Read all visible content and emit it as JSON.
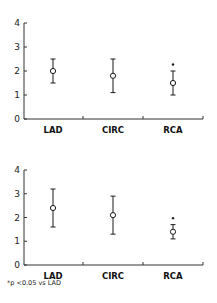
{
  "chart_data": [
    {
      "type": "scatter",
      "subtype": "mean-with-error-bars",
      "title": "",
      "xlabel": "",
      "ylabel": "",
      "categories": [
        "LAD",
        "CIRC",
        "RCA"
      ],
      "yticks": [
        "0",
        "1",
        "2",
        "3",
        "4"
      ],
      "ylim": [
        0,
        4
      ],
      "grid": false,
      "legend": null,
      "series": [
        {
          "name": "Panel 1",
          "mean": [
            2.0,
            1.8,
            1.5
          ],
          "upper": [
            2.5,
            2.5,
            2.0
          ],
          "lower": [
            1.5,
            1.1,
            1.0
          ],
          "significance_marker": [
            "",
            "",
            "*"
          ]
        }
      ]
    },
    {
      "type": "scatter",
      "subtype": "mean-with-error-bars",
      "title": "",
      "xlabel": "",
      "ylabel": "",
      "categories": [
        "LAD",
        "CIRC",
        "RCA"
      ],
      "yticks": [
        "0",
        "1",
        "2",
        "3",
        "4"
      ],
      "ylim": [
        0,
        4
      ],
      "grid": false,
      "legend": null,
      "series": [
        {
          "name": "Panel 2",
          "mean": [
            2.4,
            2.1,
            1.4
          ],
          "upper": [
            3.2,
            2.9,
            1.7
          ],
          "lower": [
            1.6,
            1.3,
            1.1
          ],
          "significance_marker": [
            "",
            "",
            "*"
          ]
        }
      ]
    }
  ],
  "footnote": "*p <0.05 vs LAD",
  "colors": {
    "ink": "#1a1a1a",
    "axis": "#333333",
    "marker_fill": "#ffffff"
  }
}
